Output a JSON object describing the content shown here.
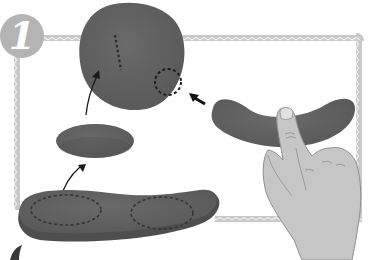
{
  "illustration": {
    "step_number": "1",
    "description": "Step 1: clay shaping instructions — roll a sausage into a flat elongated sole, cut an oval, form a rounded head shape with dotted marking lines, and bend a sausage shape with a finger",
    "colors": {
      "background": "#ffffff",
      "frame": "#c8c8c8",
      "frame_zigzag": "#e6e6e6",
      "badge": "#b4b4b4",
      "clay": "#5e5e5e",
      "clay_shadow": "#4a4a4a",
      "hand": "#c4c4c4",
      "hand_outline": "#8e8e8e",
      "dotted_line": "#2a2a2a",
      "arrow": "#1a1a1a"
    },
    "elements": [
      {
        "name": "large-rounded-clay-blob",
        "note": "with short dotted line and dotted circle"
      },
      {
        "name": "small-oval-clay-disc"
      },
      {
        "name": "long-flat-clay-sole",
        "note": "with two dotted ovals"
      },
      {
        "name": "bent-clay-sausage",
        "note": "pressed by finger"
      },
      {
        "name": "hand",
        "note": "index finger pressing center of sausage"
      }
    ]
  }
}
